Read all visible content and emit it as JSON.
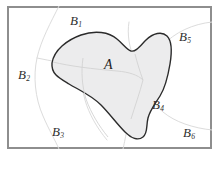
{
  "figure": {
    "type": "partition-venn-diagram",
    "caption": "",
    "frame": {
      "border_color": "#8e8e8e",
      "background_color": "#ffffff"
    },
    "set_a": {
      "label": "A",
      "fill_color": "#ececed",
      "outline_color": "#2b2b2b"
    },
    "partition": {
      "curve_color": "#dcdcdc",
      "regions": [
        {
          "id": "b1",
          "base": "B",
          "subscript": "1"
        },
        {
          "id": "b2",
          "base": "B",
          "subscript": "2"
        },
        {
          "id": "b3",
          "base": "B",
          "subscript": "3"
        },
        {
          "id": "b4",
          "base": "B",
          "subscript": "4"
        },
        {
          "id": "b5",
          "base": "B",
          "subscript": "5"
        },
        {
          "id": "b6",
          "base": "B",
          "subscript": "6"
        }
      ]
    }
  }
}
